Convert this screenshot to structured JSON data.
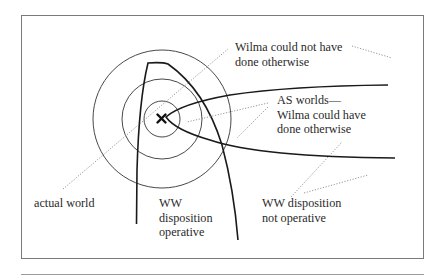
{
  "figure": {
    "labels": {
      "could_not": "Wilma could not have\ndone otherwise",
      "as_worlds": "AS worlds—\nWilma could have\ndone otherwise",
      "actual_world": "actual world",
      "ww_operative": "WW\ndisposition\noperative",
      "ww_not_operative": "WW disposition\nnot operative"
    },
    "center_marker": "×",
    "colors": {
      "line": "#1a1a1a",
      "thin_line": "#333333",
      "dotted": "#8a8a8a",
      "frame": "#7a7a7a",
      "background": "#ffffff"
    }
  }
}
